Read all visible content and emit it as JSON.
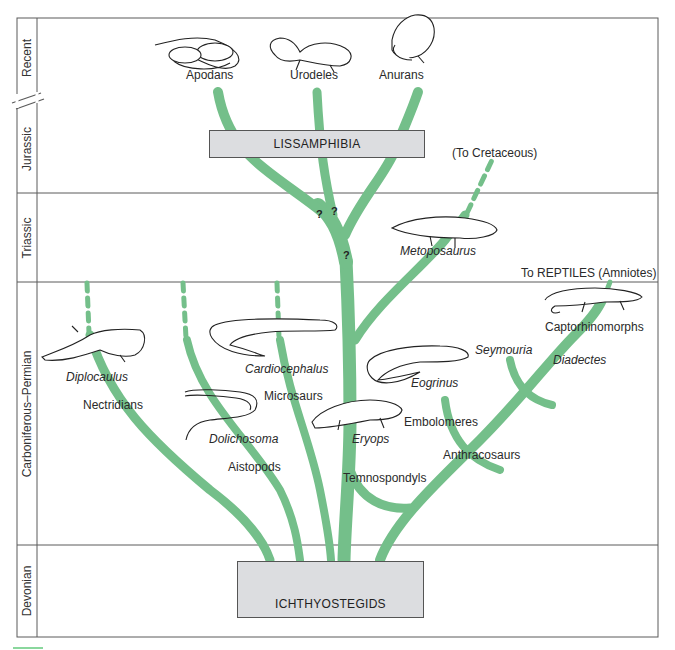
{
  "figure": {
    "branch_color": "#74bf8a",
    "box_fill": "#dcdde0",
    "frame_color": "#555555"
  },
  "periods": [
    {
      "label": "Recent"
    },
    {
      "label": "Jurassic"
    },
    {
      "label": "Triassic"
    },
    {
      "label": "Carboniferous–Permian"
    },
    {
      "label": "Devonian"
    }
  ],
  "boxes": {
    "lissamphibia": "LISSAMPHIBIA",
    "ichthyostegids": "ICHTHYOSTEGIDS"
  },
  "recent_taxa": [
    {
      "label": "Apodans"
    },
    {
      "label": "Urodeles"
    },
    {
      "label": "Anurans"
    }
  ],
  "annotations": {
    "to_cretaceous": "(To Cretaceous)",
    "to_reptiles": "To REPTILES (Amniotes)",
    "uncertain": "?"
  },
  "genera": [
    {
      "label": "Metoposaurus"
    },
    {
      "label": "Diplocaulus"
    },
    {
      "label": "Cardiocephalus"
    },
    {
      "label": "Dolichosoma"
    },
    {
      "label": "Eryops"
    },
    {
      "label": "Eogrinus"
    },
    {
      "label": "Seymouria"
    },
    {
      "label": "Diadectes"
    }
  ],
  "groups": [
    {
      "label": "Nectridians"
    },
    {
      "label": "Microsaurs"
    },
    {
      "label": "Aistopods"
    },
    {
      "label": "Temnospondyls"
    },
    {
      "label": "Embolomeres"
    },
    {
      "label": "Anthracosaurs"
    },
    {
      "label": "Captorhinomorphs"
    }
  ]
}
